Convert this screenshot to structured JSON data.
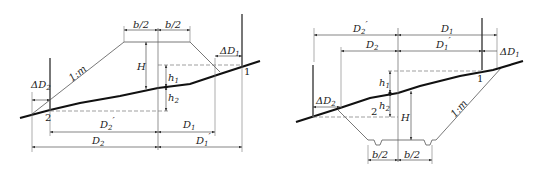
{
  "diagram": {
    "colors": {
      "line": "#444444",
      "ground": "#111111",
      "dash": "#666666",
      "background": "#ffffff"
    },
    "left_figure": {
      "name": "embankment-section",
      "labels": {
        "b_half_left": "b/2",
        "b_half_right": "b/2",
        "height": "H",
        "h1": "h",
        "h1_sub": "1",
        "h2": "h",
        "h2_sub": "2",
        "slope": "1:m",
        "delta_d1": "ΔD",
        "delta_d1_sub": "1",
        "delta_d2": "ΔD",
        "delta_d2_sub": "2",
        "point1": "1",
        "point2": "2",
        "d2_prime": "D",
        "d2_prime_sub": "2",
        "d2_prime_mark": "′",
        "d2": "D",
        "d2_sub": "2",
        "d1": "D",
        "d1_sub": "1",
        "d1_prime": "D",
        "d1_prime_sub": "1",
        "d1_prime_mark": "′"
      }
    },
    "right_figure": {
      "name": "cutting-section",
      "labels": {
        "d2_prime": "D",
        "d2_prime_sub": "2",
        "d2_prime_mark": "′",
        "d1": "D",
        "d1_sub": "1",
        "d2": "D",
        "d2_sub": "2",
        "d1_prime": "D",
        "d1_prime_sub": "1",
        "d1_prime_mark": "′",
        "delta_d1": "ΔD",
        "delta_d1_sub": "1",
        "delta_d2": "ΔD",
        "delta_d2_sub": "2",
        "h1": "h",
        "h1_sub": "1",
        "h2": "h",
        "h2_sub": "2",
        "height": "H",
        "slope": "1:m",
        "point1": "1",
        "point2": "2",
        "b_half_left": "b/2",
        "b_half_right": "b/2"
      }
    }
  }
}
